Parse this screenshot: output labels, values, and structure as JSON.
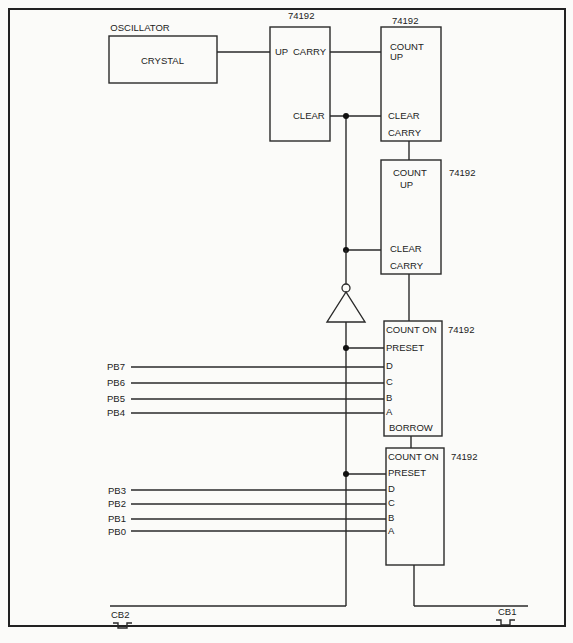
{
  "oscillator": {
    "title": "OSCILLATOR",
    "label": "CRYSTAL"
  },
  "chips": [
    {
      "id": "u1",
      "part": "74192",
      "pins": [
        "UP",
        "CARRY",
        "CLEAR"
      ]
    },
    {
      "id": "u2",
      "part": "74192",
      "pins": [
        "COUNT",
        "UP",
        "CLEAR",
        "CARRY"
      ]
    },
    {
      "id": "u3",
      "part": "74192",
      "pins": [
        "COUNT",
        "UP",
        "CLEAR",
        "CARRY"
      ]
    },
    {
      "id": "u4",
      "part": "74192",
      "pins": [
        "COUNT ON",
        "PRESET",
        "D",
        "C",
        "B",
        "A",
        "BORROW"
      ]
    },
    {
      "id": "u5",
      "part": "74192",
      "pins": [
        "COUNT ON",
        "PRESET",
        "D",
        "C",
        "B",
        "A"
      ]
    }
  ],
  "inputs_high": [
    "PB7",
    "PB6",
    "PB5",
    "PB4"
  ],
  "inputs_low": [
    "PB3",
    "PB2",
    "PB1",
    "PB0"
  ],
  "signals": {
    "cb2": "CB2",
    "cb1": "CB1"
  }
}
